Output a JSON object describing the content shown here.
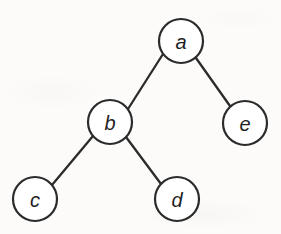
{
  "figure": {
    "kind": "binary-tree-diagram",
    "width": 281,
    "height": 234,
    "background_color": "#fcfbfa",
    "stroke_color": "#2b2b2b",
    "node_fill_color": "#ffffff",
    "label_color": "#1f1f1f",
    "node_radius": 22
  },
  "nodes": [
    {
      "id": "a",
      "label": "a",
      "cx": 181,
      "cy": 41,
      "r": 22,
      "role": "root"
    },
    {
      "id": "b",
      "label": "b",
      "cx": 110,
      "cy": 122,
      "r": 22,
      "role": "internal"
    },
    {
      "id": "e",
      "label": "e",
      "cx": 245,
      "cy": 123,
      "r": 22,
      "role": "leaf"
    },
    {
      "id": "c",
      "label": "c",
      "cx": 35,
      "cy": 199,
      "r": 22,
      "role": "leaf"
    },
    {
      "id": "d",
      "label": "d",
      "cx": 177,
      "cy": 199,
      "r": 22,
      "role": "leaf"
    }
  ],
  "edges": [
    {
      "id": "a-b",
      "from": "a",
      "to": "b",
      "x1": 163,
      "y1": 54,
      "x2": 128,
      "y2": 109
    },
    {
      "id": "a-e",
      "from": "a",
      "to": "e",
      "x1": 196,
      "y1": 58,
      "x2": 230,
      "y2": 106
    },
    {
      "id": "b-c",
      "from": "b",
      "to": "c",
      "x1": 93,
      "y1": 136,
      "x2": 52,
      "y2": 185
    },
    {
      "id": "b-d",
      "from": "b",
      "to": "d",
      "x1": 126,
      "y1": 137,
      "x2": 161,
      "y2": 184
    }
  ]
}
